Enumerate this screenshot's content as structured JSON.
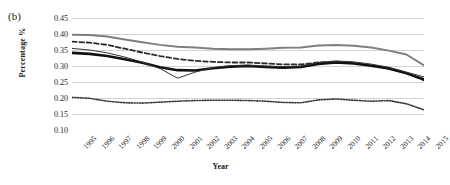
{
  "panel": {
    "label": "(b)"
  },
  "chart_data": {
    "type": "line",
    "title": "",
    "xlabel": "Year",
    "ylabel": "Percentage %",
    "xlim": [
      1995,
      2015
    ],
    "ylim": [
      0.1,
      0.45
    ],
    "yticks": [
      "0.45",
      "0.40",
      "0.35",
      "0.30",
      "0.25",
      "0.20",
      "0.15",
      "0.10"
    ],
    "ytick_values": [
      0.45,
      0.4,
      0.35,
      0.3,
      0.25,
      0.2,
      0.15,
      0.1
    ],
    "grid": "horizontal",
    "legend": "none",
    "categories": [
      "1995",
      "1996",
      "1997",
      "1998",
      "1999",
      "2000",
      "2001",
      "2002",
      "2003",
      "2004",
      "2005",
      "2006",
      "2007",
      "2008",
      "2009",
      "2010",
      "2011",
      "2012",
      "2013",
      "2014",
      "2015"
    ],
    "x": [
      1995,
      1996,
      1997,
      1998,
      1999,
      2000,
      2001,
      2002,
      2003,
      2004,
      2005,
      2006,
      2007,
      2008,
      2009,
      2010,
      2011,
      2012,
      2013,
      2014,
      2015
    ],
    "series": [
      {
        "name": "gray-solid-upper",
        "style": "solid",
        "color": "#7f7f7f",
        "width": 2.0,
        "values": [
          0.398,
          0.397,
          0.392,
          0.383,
          0.374,
          0.366,
          0.36,
          0.358,
          0.354,
          0.352,
          0.352,
          0.354,
          0.357,
          0.358,
          0.364,
          0.366,
          0.363,
          0.358,
          0.348,
          0.336,
          0.302
        ]
      },
      {
        "name": "black-dashed",
        "style": "dashed",
        "color": "#2b2b2b",
        "width": 1.8,
        "values": [
          0.376,
          0.373,
          0.366,
          0.354,
          0.342,
          0.331,
          0.322,
          0.316,
          0.313,
          0.311,
          0.311,
          0.308,
          0.305,
          0.305,
          0.311,
          0.313,
          0.309,
          0.302,
          0.292,
          0.278,
          0.256
        ]
      },
      {
        "name": "black-thick-solid",
        "style": "solid",
        "color": "#111111",
        "width": 2.6,
        "values": [
          0.341,
          0.338,
          0.331,
          0.321,
          0.31,
          0.296,
          0.287,
          0.286,
          0.293,
          0.298,
          0.3,
          0.297,
          0.295,
          0.297,
          0.306,
          0.311,
          0.308,
          0.301,
          0.292,
          0.277,
          0.258
        ]
      },
      {
        "name": "black-thin-solid",
        "style": "solid",
        "color": "#333333",
        "width": 1.0,
        "values": [
          0.355,
          0.35,
          0.341,
          0.328,
          0.312,
          0.292,
          0.262,
          0.281,
          0.295,
          0.301,
          0.303,
          0.3,
          0.298,
          0.3,
          0.311,
          0.316,
          0.313,
          0.306,
          0.296,
          0.281,
          0.266
        ]
      },
      {
        "name": "black-dotted-lower",
        "style": "dotted",
        "color": "#3a3a3a",
        "width": 1.6,
        "values": [
          0.202,
          0.199,
          0.19,
          0.185,
          0.184,
          0.187,
          0.19,
          0.192,
          0.193,
          0.193,
          0.192,
          0.19,
          0.186,
          0.185,
          0.194,
          0.197,
          0.193,
          0.19,
          0.192,
          0.182,
          0.163
        ]
      }
    ]
  }
}
